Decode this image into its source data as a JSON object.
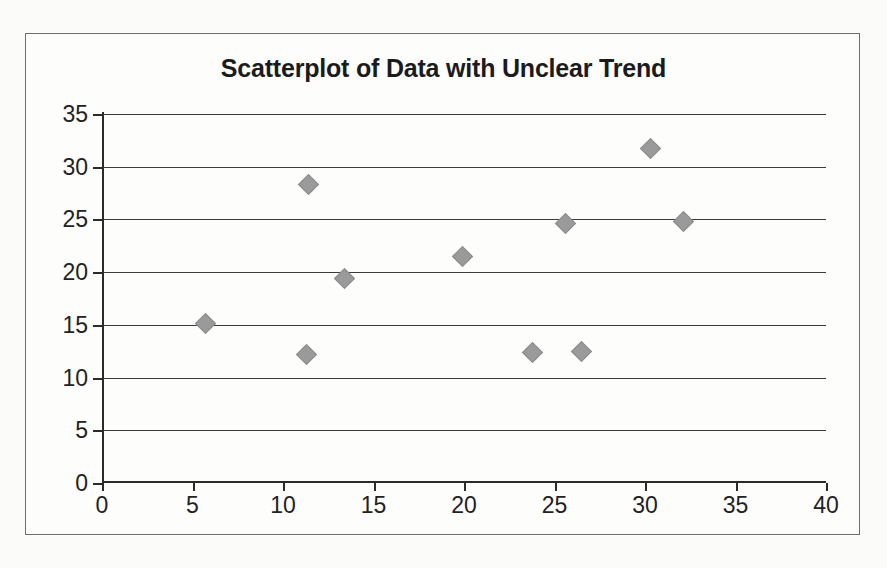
{
  "chart_data": {
    "type": "scatter",
    "title": "Scatterplot of Data with Unclear Trend",
    "xlabel": "",
    "ylabel": "",
    "xlim": [
      0,
      40
    ],
    "ylim": [
      0,
      35
    ],
    "x_ticks": [
      0,
      5,
      10,
      15,
      20,
      25,
      30,
      35,
      40
    ],
    "y_ticks": [
      0,
      5,
      10,
      15,
      20,
      25,
      30,
      35
    ],
    "grid": "horizontal",
    "legend": "none",
    "marker_shape": "diamond",
    "marker_color": "#9a9a9a",
    "points": [
      {
        "x": 5.7,
        "y": 15.1
      },
      {
        "x": 11.3,
        "y": 12.2
      },
      {
        "x": 11.4,
        "y": 28.3
      },
      {
        "x": 13.4,
        "y": 19.4
      },
      {
        "x": 19.9,
        "y": 21.5
      },
      {
        "x": 23.8,
        "y": 12.4
      },
      {
        "x": 25.6,
        "y": 24.6
      },
      {
        "x": 26.5,
        "y": 12.5
      },
      {
        "x": 30.3,
        "y": 31.7
      },
      {
        "x": 32.1,
        "y": 24.8
      }
    ]
  },
  "colors": {
    "marker": "#9a9a9a",
    "axis": "#2b2b2b",
    "gridline": "#3a3a3a",
    "frame": "#6f6f6f",
    "background": "#fbfbfa",
    "title_text": "#1b1b1b"
  }
}
